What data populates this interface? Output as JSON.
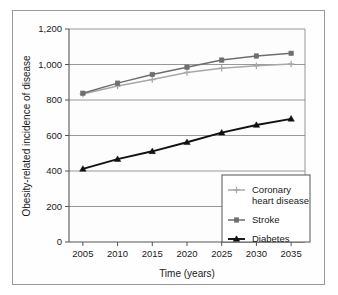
{
  "figure": {
    "name": "obesity-related-disease-incidence-line-chart"
  },
  "chart_data": {
    "type": "line",
    "title": "",
    "xlabel": "Time (years)",
    "ylabel": "Obesity-related incidence of disease",
    "x": [
      2005,
      2010,
      2015,
      2020,
      2025,
      2030,
      2035
    ],
    "xtick_labels": [
      "2005",
      "2010",
      "2015",
      "2020",
      "2025",
      "2030",
      "2035"
    ],
    "ytick_labels": [
      "0",
      "200",
      "400",
      "600",
      "800",
      "1,000",
      "1,200"
    ],
    "yticks": [
      0,
      200,
      400,
      600,
      800,
      1000,
      1200
    ],
    "ylim": [
      0,
      1200
    ],
    "xlim": [
      2003,
      2037
    ],
    "grid": "horizontal",
    "legend_position": "lower-right-inside",
    "series": [
      {
        "name": "Coronary heart disease",
        "label_line1": "Coronary",
        "label_line2": "heart disease",
        "marker": "plus",
        "color": "#a8a8a8",
        "values": [
          834,
          879,
          915,
          955,
          979,
          993,
          1003
        ]
      },
      {
        "name": "Stroke",
        "label_line1": "Stroke",
        "label_line2": "",
        "marker": "square",
        "color": "#6e6e6e",
        "values": [
          838,
          895,
          944,
          985,
          1025,
          1048,
          1063
        ]
      },
      {
        "name": "Diabetes",
        "label_line1": "Diabetes",
        "label_line2": "",
        "marker": "triangle",
        "color": "#111111",
        "values": [
          412,
          467,
          511,
          562,
          616,
          659,
          694
        ]
      }
    ]
  },
  "colors": {
    "plot_border": "#555555",
    "gridline": "#8c8c8c",
    "outer_frame": "#9a9a9a",
    "text": "#1a1a1a",
    "plot_background": "#fdfdfd",
    "legend_border": "#555555"
  }
}
